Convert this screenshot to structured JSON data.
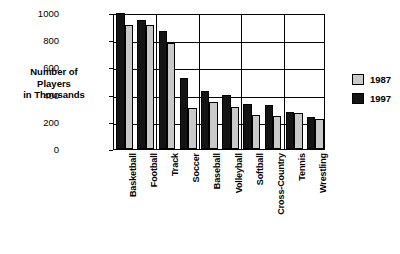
{
  "chart_data": {
    "type": "bar",
    "title": "",
    "xlabel": "",
    "ylabel": "Number of Players in Thousands",
    "ylim": [
      0,
      1000
    ],
    "yticks": [
      0,
      200,
      400,
      600,
      800,
      1000
    ],
    "grid": true,
    "legend_position": "right",
    "categories": [
      "Basketball",
      "Football",
      "Track",
      "Soccer",
      "Baseball",
      "Volleyball",
      "Softball",
      "Cross-Country",
      "Tennis",
      "Wrestling"
    ],
    "series": [
      {
        "name": "1987",
        "color": "#c9c9c9",
        "values": [
          910,
          910,
          780,
          300,
          345,
          310,
          250,
          240,
          265,
          220
        ]
      },
      {
        "name": "1997",
        "color": "#141414",
        "values": [
          1000,
          950,
          865,
          520,
          430,
          395,
          330,
          320,
          270,
          235
        ]
      }
    ]
  },
  "axis_title": {
    "line1": "Number of",
    "line2": "Players",
    "line3": "in Thousands"
  },
  "legend": {
    "items": [
      {
        "label": "1987"
      },
      {
        "label": "1997"
      }
    ]
  }
}
